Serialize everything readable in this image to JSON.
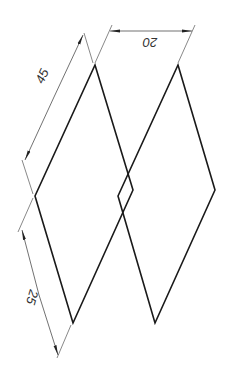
{
  "drawing": {
    "type": "technical-dimension-drawing",
    "shapes": [
      {
        "name": "left-rhombus",
        "points": [
          [
            95,
            65
          ],
          [
            133,
            190
          ],
          [
            73,
            323
          ],
          [
            35,
            196
          ]
        ]
      },
      {
        "name": "right-rhombus",
        "points": [
          [
            178,
            65
          ],
          [
            215,
            190
          ],
          [
            155,
            323
          ],
          [
            118,
            196
          ]
        ]
      }
    ],
    "dimensions": [
      {
        "name": "horizontal-offset",
        "label": "20"
      },
      {
        "name": "upper-side-length",
        "label": "45"
      },
      {
        "name": "lower-side-length",
        "label": "25"
      }
    ],
    "colors": {
      "shape_stroke": "#1a1a1a",
      "dimension_stroke": "#555555",
      "background": "#ffffff"
    }
  }
}
